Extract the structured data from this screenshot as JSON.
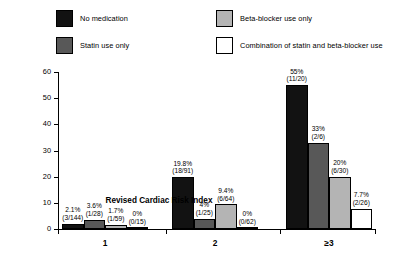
{
  "chart_data": {
    "type": "bar",
    "title": "",
    "xlabel": "Revised Cardiac Risk Index",
    "ylabel": "Incidence of perioperative events, %",
    "categories": [
      "1",
      "2",
      "≥3"
    ],
    "ylim": [
      0,
      60
    ],
    "yticks": [
      0,
      10,
      20,
      30,
      40,
      50,
      60
    ],
    "ytick_labels": [
      "0",
      "10",
      "20",
      "30",
      "40",
      "50",
      "60"
    ],
    "grid": false,
    "legend_position": "top",
    "series": [
      {
        "name": "No medication",
        "color": "#121212",
        "values": [
          2.1,
          19.8,
          55
        ],
        "labels": [
          "2.1%",
          "19.8%",
          "55%"
        ],
        "fractions": [
          "(3/144)",
          "(18/91)",
          "(11/20)"
        ]
      },
      {
        "name": "Statin use only",
        "color": "#585858",
        "values": [
          3.6,
          4,
          33
        ],
        "labels": [
          "3.6%",
          "4%",
          "33%"
        ],
        "fractions": [
          "(1/28)",
          "(1/25)",
          "(2/6)"
        ]
      },
      {
        "name": "Beta-blocker use only",
        "color": "#b4b4b4",
        "values": [
          1.7,
          9.4,
          20
        ],
        "labels": [
          "1.7%",
          "9.4%",
          "20%"
        ],
        "fractions": [
          "(1/59)",
          "(6/64)",
          "(6/30)"
        ]
      },
      {
        "name": "Combination of statin and beta-blocker use",
        "color": "#ffffff",
        "values": [
          0,
          0,
          7.7
        ],
        "labels": [
          "0%",
          "0%",
          "7.7%"
        ],
        "fractions": [
          "(0/15)",
          "(0/62)",
          "(2/26)"
        ]
      }
    ]
  },
  "legend": {
    "items": [
      {
        "label": "No medication",
        "color": "#121212"
      },
      {
        "label": "Statin use only",
        "color": "#585858"
      },
      {
        "label": "Beta-blocker use only",
        "color": "#b4b4b4"
      },
      {
        "label": "Combination of statin and beta-blocker use",
        "color": "#ffffff"
      }
    ]
  },
  "axes": {
    "y_title": "Incidence of perioperative events, %",
    "x_title": "Revised Cardiac Risk Index"
  }
}
